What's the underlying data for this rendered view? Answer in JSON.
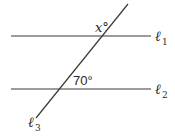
{
  "diagram": {
    "type": "parallel-lines-transversal",
    "line_color": "#3a3a3a",
    "lines": [
      {
        "id": "l1",
        "label": "ℓ",
        "subscript": "1",
        "x1": 11,
        "y1": 36,
        "x2": 151,
        "y2": 36
      },
      {
        "id": "l2",
        "label": "ℓ",
        "subscript": "2",
        "x1": 11,
        "y1": 89,
        "x2": 151,
        "y2": 89
      },
      {
        "id": "l3",
        "label": "ℓ",
        "subscript": "3",
        "x1": 128,
        "y1": 4,
        "x2": 36,
        "y2": 118
      }
    ],
    "angles": {
      "x_label": "x°",
      "given_label": "70°"
    }
  }
}
